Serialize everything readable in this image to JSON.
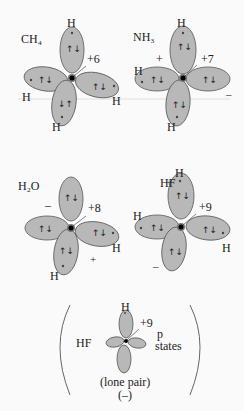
{
  "figure": {
    "background": "#fafafa",
    "lobe_color": "#b8b8b8",
    "panels": [
      {
        "id": "ch4",
        "molecule": "CH₄",
        "charge": "+6",
        "h_labels": [
          "H",
          "H",
          "H",
          "H"
        ],
        "side_signs": [],
        "electron_pairs": "↑↓"
      },
      {
        "id": "nh3",
        "molecule": "NH₃",
        "charge": "+7",
        "h_labels": [
          "H",
          "H",
          "H"
        ],
        "side_signs": [
          "+",
          "–"
        ],
        "electron_pairs": "↑↓"
      },
      {
        "id": "h2o",
        "molecule": "H₂O",
        "charge": "+8",
        "h_labels": [
          "H",
          "H"
        ],
        "side_signs": [
          "–",
          "+"
        ],
        "electron_pairs": "↑↓"
      },
      {
        "id": "hf",
        "molecule": "HF",
        "charge": "+9",
        "h_labels": [
          "H",
          "H",
          "H"
        ],
        "side_signs": [
          "+",
          "–"
        ],
        "electron_pairs": "↑↓"
      }
    ],
    "bottom_panel": {
      "molecule": "HF",
      "h_label": "H",
      "charge": "+9",
      "side_label_line1": "p",
      "side_label_line2": "states",
      "caption_line1": "(lone pair)",
      "caption_line2": "(–)"
    }
  }
}
